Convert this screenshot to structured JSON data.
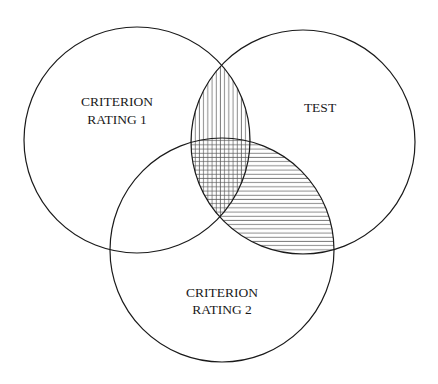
{
  "diagram": {
    "type": "venn",
    "sets": [
      {
        "id": "criterion1",
        "label_line1": "CRITERION",
        "label_line2": "RATING 1",
        "cx": 137,
        "cy": 140,
        "r": 113
      },
      {
        "id": "test",
        "label_line1": "TEST",
        "label_line2": "",
        "cx": 303,
        "cy": 142,
        "r": 112
      },
      {
        "id": "criterion2",
        "label_line1": "CRITERION",
        "label_line2": "RATING 2",
        "cx": 222,
        "cy": 250,
        "r": 112
      }
    ],
    "shading": {
      "test_and_criterion1": "vertical-lines",
      "test_and_criterion2": "horizontal-lines",
      "all_three": "crosshatch"
    },
    "colors": {
      "stroke": "#1a1a1a",
      "hatch": "#555555",
      "background": "#ffffff"
    }
  }
}
